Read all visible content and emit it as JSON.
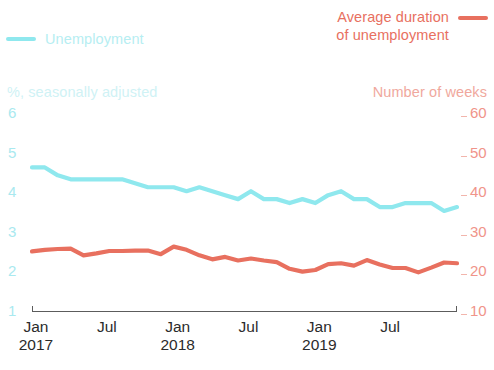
{
  "legend": {
    "left": {
      "label": "Unemployment",
      "color": "#8FE8EE"
    },
    "right": {
      "line1": "Average duration",
      "line2": "of unemployment",
      "color": "#E8705F"
    }
  },
  "axis_captions": {
    "left": "%, seasonally adjusted",
    "right": "Number of weeks"
  },
  "yticks_left": [
    "6",
    "5",
    "4",
    "3",
    "2",
    "1"
  ],
  "yticks_right": [
    "60",
    "50",
    "40",
    "30",
    "20",
    "10"
  ],
  "xticks": [
    {
      "month": "Jan",
      "year": "2017"
    },
    {
      "month": "Jul",
      "year": ""
    },
    {
      "month": "Jan",
      "year": "2018"
    },
    {
      "month": "Jul",
      "year": ""
    },
    {
      "month": "Jan",
      "year": "2019"
    },
    {
      "month": "Jul",
      "year": ""
    }
  ],
  "chart_data": {
    "type": "line",
    "title": "",
    "xlabel": "",
    "grid": false,
    "legend_position": "top",
    "x": [
      "2017-01",
      "2017-02",
      "2017-03",
      "2017-04",
      "2017-05",
      "2017-06",
      "2017-07",
      "2017-08",
      "2017-09",
      "2017-10",
      "2017-11",
      "2017-12",
      "2018-01",
      "2018-02",
      "2018-03",
      "2018-04",
      "2018-05",
      "2018-06",
      "2018-07",
      "2018-08",
      "2018-09",
      "2018-10",
      "2018-11",
      "2018-12",
      "2019-01",
      "2019-02",
      "2019-03",
      "2019-04",
      "2019-05",
      "2019-06",
      "2019-07",
      "2019-08",
      "2019-09",
      "2019-10"
    ],
    "series": [
      {
        "name": "Unemployment",
        "color": "#8FE8EE",
        "axis": "left",
        "ylabel": "%, seasonally adjusted",
        "ylim": [
          1,
          6
        ],
        "units": "%",
        "values": [
          4.6,
          4.6,
          4.4,
          4.3,
          4.3,
          4.3,
          4.3,
          4.3,
          4.2,
          4.1,
          4.1,
          4.1,
          4.0,
          4.1,
          4.0,
          3.9,
          3.8,
          4.0,
          3.8,
          3.8,
          3.7,
          3.8,
          3.7,
          3.9,
          4.0,
          3.8,
          3.8,
          3.6,
          3.6,
          3.7,
          3.7,
          3.7,
          3.5,
          3.6
        ]
      },
      {
        "name": "Average duration of unemployment",
        "color": "#E8705F",
        "axis": "right",
        "ylabel": "Number of weeks",
        "ylim": [
          10,
          60
        ],
        "units": "weeks",
        "values": [
          24.8,
          25.2,
          25.4,
          25.5,
          23.8,
          24.3,
          24.9,
          24.9,
          25.0,
          25.0,
          24.1,
          26.0,
          25.2,
          23.8,
          22.8,
          23.4,
          22.5,
          23.0,
          22.5,
          22.1,
          20.4,
          19.7,
          20.1,
          21.6,
          21.8,
          21.2,
          22.6,
          21.5,
          20.6,
          20.6,
          19.5,
          20.7,
          22.0,
          21.8
        ]
      }
    ]
  }
}
